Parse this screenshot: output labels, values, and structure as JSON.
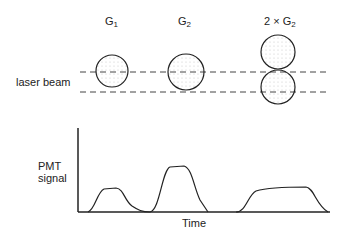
{
  "labels": {
    "g1": "G",
    "g1_sub": "1",
    "g2": "G",
    "g2_sub": "2",
    "g2x2": "2 × G",
    "g2x2_sub": "2",
    "laser_beam": "laser beam",
    "pmt_line1": "PMT",
    "pmt_line2": "signal",
    "time": "Time"
  },
  "colors": {
    "stroke": "#222222",
    "dots": "#bbbbbb",
    "background": "#ffffff"
  }
}
